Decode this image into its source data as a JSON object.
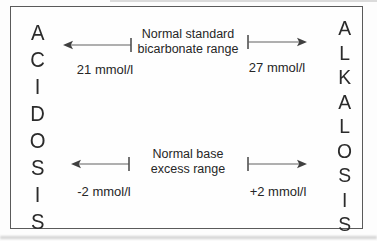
{
  "diagram": {
    "left_word": "ACIDOSIS",
    "right_word": "ALKALOSIS",
    "bicarbonate_range": {
      "label_line1": "Normal standard",
      "label_line2": "bicarbonate range",
      "low_value": "21 mmol/l",
      "high_value": "27 mmol/l"
    },
    "base_excess_range": {
      "label_line1": "Normal base",
      "label_line2": "excess range",
      "low_value": "-2 mmol/l",
      "high_value": "+2 mmol/l"
    },
    "colors": {
      "background": "#fdfdfd",
      "border": "#5a5a5a",
      "text": "#262626",
      "arrow_line": "#606060",
      "arrow_head": "#404040"
    }
  }
}
